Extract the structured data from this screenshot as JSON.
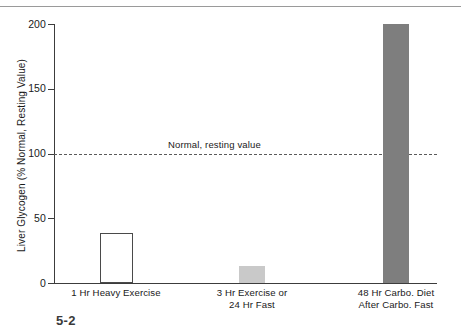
{
  "figure": {
    "caption_partial": "5-2"
  },
  "chart_data": {
    "type": "bar",
    "title": "",
    "xlabel": "",
    "ylabel": "Liver Glycogen (% Normal, Resting Value)",
    "ylim": [
      0,
      200
    ],
    "yticks": [
      0,
      50,
      100,
      150,
      200
    ],
    "ytick_labels": [
      "0",
      "50",
      "100",
      "150",
      "200"
    ],
    "grid": false,
    "legend": "none",
    "categories": [
      "1 Hr Heavy Exercise",
      "3 Hr Exercise or 24 Hr Fast",
      "48 Hr Carbo. Diet After Carbo. Fast"
    ],
    "category_lines": [
      [
        "1 Hr Heavy Exercise"
      ],
      [
        "3 Hr Exercise or",
        "24 Hr Fast"
      ],
      [
        "48 Hr Carbo. Diet",
        "After Carbo. Fast"
      ]
    ],
    "values": [
      39,
      13,
      200
    ],
    "bar_styles": [
      {
        "fill": "#ffffff",
        "edge": "#4a4a4a"
      },
      {
        "fill": "#c9c9c9",
        "edge": "#c9c9c9"
      },
      {
        "fill": "#7e7e7e",
        "edge": "#7e7e7e"
      }
    ],
    "annotations": [
      {
        "type": "hline",
        "value": 100,
        "label": "Normal, resting value",
        "style": "dashed",
        "color": "#5a5a5a"
      }
    ]
  }
}
